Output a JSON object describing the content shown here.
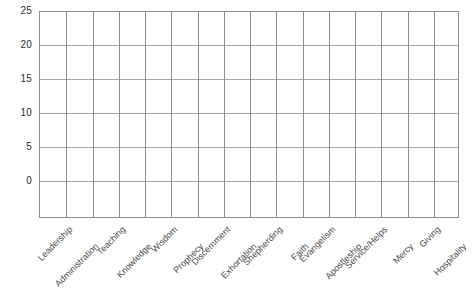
{
  "chart_data": {
    "type": "bar",
    "title": "",
    "subtitle": "",
    "xlabel": "",
    "ylabel": "",
    "categories": [
      "Leadership",
      "Administration",
      "Teaching",
      "Knowledge",
      "Wisdom",
      "Prophecy",
      "Discernment",
      "Exhortation",
      "Shepherding",
      "Faith",
      "Evangelism",
      "Apostleship",
      "Service/Helps",
      "Mercy",
      "Giving",
      "Hospitality"
    ],
    "values": [
      0,
      0,
      0,
      0,
      0,
      0,
      0,
      0,
      0,
      0,
      0,
      0,
      0,
      0,
      0,
      0
    ],
    "ylim": [
      0,
      25
    ],
    "ytick_labels": [
      "0",
      "5",
      "10",
      "15",
      "20",
      "25"
    ],
    "ytick_values": [
      0,
      5,
      10,
      15,
      20,
      25
    ],
    "ystep": 5,
    "grid": true,
    "legend": "none",
    "colors": {
      "background": "#ffffff",
      "plot_border": "#8d8d8d",
      "gridline_horizontal": "#a8a8a8",
      "gridline_vertical": "#8d8d8d",
      "ytick_text": "#2e2e2e",
      "xtick_text": "#4a4a4a"
    }
  }
}
